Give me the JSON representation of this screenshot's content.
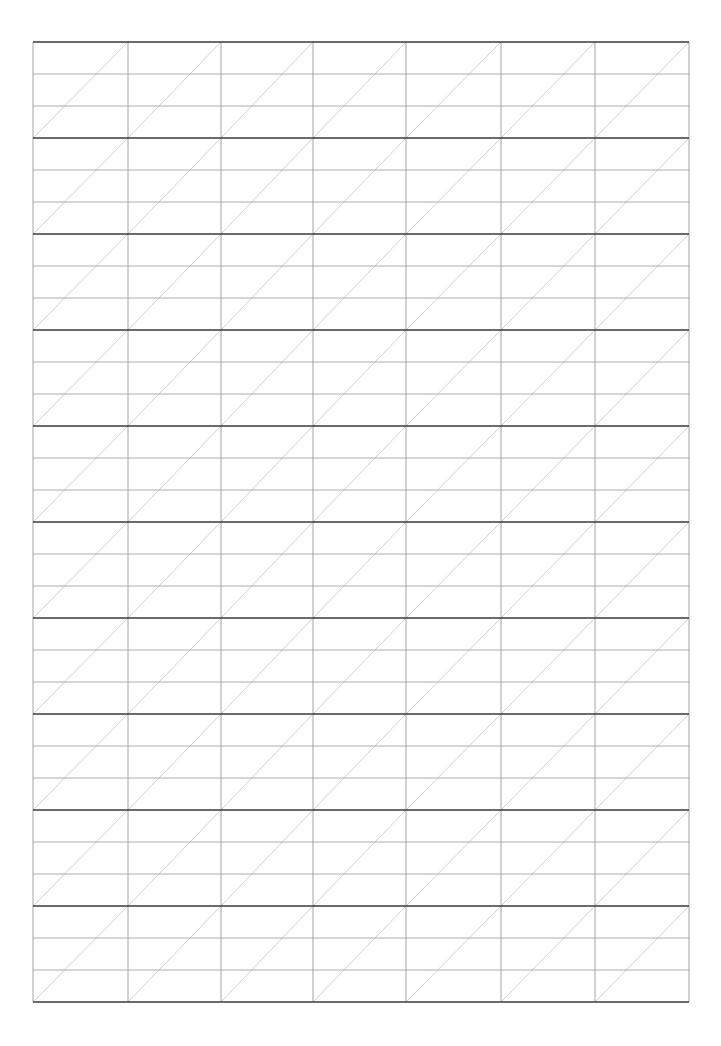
{
  "page": {
    "type": "blank ruled practice sheet",
    "background": "#ffffff"
  },
  "grid": {
    "left": 33,
    "top": 42,
    "right": 689,
    "bottom": 1002,
    "columns": 7,
    "blocks": 10,
    "subrows_per_block": 3,
    "column_x": [
      33,
      128,
      221,
      313,
      406,
      501,
      595,
      689
    ],
    "block_height": 96,
    "colors": {
      "block_line": "#3a3a3a",
      "sub_line": "#9a9a9a",
      "column_line": "#9a9a9a",
      "diagonal": "#c4c4c4"
    }
  }
}
